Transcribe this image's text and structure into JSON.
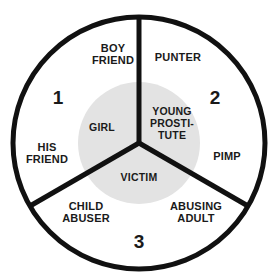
{
  "diagram": {
    "type": "three-sector-circle-venn",
    "colors": {
      "stroke": "#111111",
      "inner_disc_fill": "#e3e3e3",
      "background": "#ffffff",
      "text": "#1a1a1a"
    },
    "geometry": {
      "center_x": 139,
      "center_y": 143,
      "outer_radius": 128,
      "inner_radius": 61,
      "spoke_angles_deg": [
        90,
        210,
        330
      ],
      "stroke_width": 5
    },
    "sectors": [
      {
        "number": "1",
        "number_x": 58,
        "number_y": 98,
        "outer_labels": [
          {
            "text": "BOY\nFRIEND",
            "x": 113,
            "y": 54
          },
          {
            "text": "HIS\nFRIEND",
            "x": 47,
            "y": 153
          }
        ],
        "inner_label": {
          "text": "GIRL",
          "x": 102,
          "y": 128
        }
      },
      {
        "number": "2",
        "number_x": 215,
        "number_y": 98,
        "outer_labels": [
          {
            "text": "PUNTER",
            "x": 178,
            "y": 57
          },
          {
            "text": "PIMP",
            "x": 227,
            "y": 156
          }
        ],
        "inner_label": {
          "text": "YOUNG\nPROSTI-\nTUTE",
          "x": 172,
          "y": 124
        }
      },
      {
        "number": "3",
        "number_x": 139,
        "number_y": 242,
        "outer_labels": [
          {
            "text": "CHILD\nABUSER",
            "x": 86,
            "y": 212
          },
          {
            "text": "ABUSING\nADULT",
            "x": 196,
            "y": 212
          }
        ],
        "inner_label": {
          "text": "VICTIM",
          "x": 139,
          "y": 178
        }
      }
    ]
  }
}
